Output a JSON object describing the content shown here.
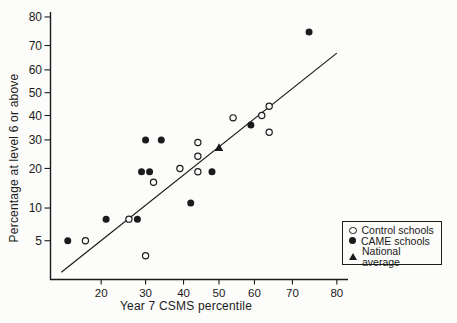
{
  "figure": {
    "background": "#fcfcfa",
    "ink_color": "#1b1b1b"
  },
  "chart_data": {
    "type": "scatter",
    "title": "",
    "xlabel": "Year 7 CSMS percentile",
    "ylabel": "Percentage at level 6 or above",
    "x_scale": "probit",
    "y_scale": "probit",
    "x_ticks": [
      20,
      30,
      40,
      50,
      60,
      70,
      80
    ],
    "y_ticks": [
      5,
      10,
      20,
      30,
      40,
      50,
      60,
      70,
      80
    ],
    "x_range": [
      12,
      82
    ],
    "y_range": [
      2.5,
      85
    ],
    "grid": false,
    "series": [
      {
        "name": "Control schools",
        "marker": "open-circle",
        "points": [
          [
            17,
            5
          ],
          [
            26,
            8
          ],
          [
            30,
            3.5
          ],
          [
            32,
            16
          ],
          [
            39,
            20
          ],
          [
            44,
            29
          ],
          [
            44,
            24
          ],
          [
            44,
            19
          ],
          [
            54,
            39
          ],
          [
            62,
            40
          ],
          [
            64,
            44
          ],
          [
            64,
            33
          ]
        ]
      },
      {
        "name": "CAME schools",
        "marker": "filled-circle",
        "points": [
          [
            14,
            5
          ],
          [
            21,
            8
          ],
          [
            28,
            8
          ],
          [
            29,
            19
          ],
          [
            31,
            19
          ],
          [
            30,
            30
          ],
          [
            34,
            30
          ],
          [
            42,
            11
          ],
          [
            48,
            19
          ],
          [
            59,
            36
          ],
          [
            74,
            75
          ]
        ]
      },
      {
        "name": "National average",
        "marker": "filled-triangle",
        "points": [
          [
            50,
            27
          ]
        ]
      }
    ],
    "trend_line": {
      "x1": 13,
      "y1": 2.3,
      "x2": 80,
      "y2": 67
    },
    "legend": {
      "position": "bottom-right",
      "entries": [
        {
          "marker": "open-circle",
          "label": "Control schools"
        },
        {
          "marker": "filled-circle",
          "label": "CAME schools"
        },
        {
          "marker": "filled-triangle",
          "label": "National average"
        }
      ]
    }
  }
}
